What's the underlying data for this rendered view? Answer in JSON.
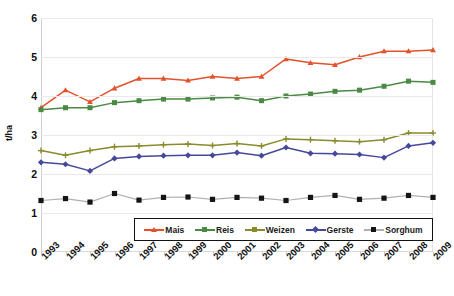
{
  "chart_data": {
    "type": "line",
    "title": "",
    "xlabel": "",
    "ylabel": "t/ha",
    "ylim": [
      0,
      6
    ],
    "yticks": [
      0,
      1,
      2,
      3,
      4,
      5,
      6
    ],
    "grid": true,
    "legend_position": "bottom",
    "categories": [
      "1993",
      "1994",
      "1995",
      "1996",
      "1997",
      "1998",
      "1999",
      "2000",
      "2001",
      "2002",
      "2003",
      "2004",
      "2005",
      "2006",
      "2007",
      "2008",
      "2009"
    ],
    "series": [
      {
        "name": "Mais",
        "color": "#E2522B",
        "marker": "triangle",
        "values": [
          3.7,
          4.15,
          3.85,
          4.2,
          4.45,
          4.45,
          4.4,
          4.5,
          4.45,
          4.5,
          4.95,
          4.85,
          4.8,
          5.0,
          5.15,
          5.15,
          5.18
        ]
      },
      {
        "name": "Reis",
        "color": "#4A8A45",
        "marker": "square",
        "values": [
          3.65,
          3.7,
          3.7,
          3.83,
          3.88,
          3.92,
          3.92,
          3.95,
          3.97,
          3.88,
          4.0,
          4.05,
          4.12,
          4.15,
          4.25,
          4.38,
          4.35
        ]
      },
      {
        "name": "Weizen",
        "color": "#8A8B2C",
        "marker": "plus",
        "values": [
          2.6,
          2.48,
          2.6,
          2.7,
          2.72,
          2.75,
          2.77,
          2.73,
          2.78,
          2.72,
          2.9,
          2.88,
          2.85,
          2.83,
          2.88,
          3.05,
          3.05
        ]
      },
      {
        "name": "Gerste",
        "color": "#46499A",
        "marker": "diamond",
        "values": [
          2.3,
          2.25,
          2.08,
          2.4,
          2.45,
          2.47,
          2.48,
          2.48,
          2.55,
          2.47,
          2.68,
          2.53,
          2.52,
          2.5,
          2.42,
          2.72,
          2.8
        ]
      },
      {
        "name": "Sorghum",
        "color": "#B0B0B0",
        "marker": "square-dark",
        "values": [
          1.32,
          1.37,
          1.28,
          1.5,
          1.33,
          1.4,
          1.41,
          1.35,
          1.4,
          1.38,
          1.32,
          1.4,
          1.45,
          1.35,
          1.38,
          1.45,
          1.4
        ]
      }
    ]
  }
}
